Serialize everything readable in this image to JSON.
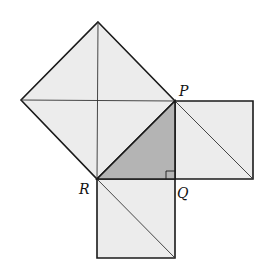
{
  "diagram": {
    "type": "pythagorean-squares",
    "colors": {
      "square_fill": "#ececec",
      "triangle_fill": "#b4b4b4",
      "stroke": "#1a1a1a",
      "background": "#ffffff"
    },
    "points": {
      "P": [
        175,
        101
      ],
      "Q": [
        175,
        179
      ],
      "R": [
        97,
        179
      ]
    },
    "labels": {
      "P": "P",
      "Q": "Q",
      "R": "R"
    },
    "shapes": {
      "hypotenuse_square": [
        [
          98,
          22
        ],
        [
          175,
          101
        ],
        [
          97,
          179
        ],
        [
          21,
          100
        ]
      ],
      "right_square": [
        [
          175,
          101
        ],
        [
          253,
          101
        ],
        [
          253,
          179
        ],
        [
          175,
          179
        ]
      ],
      "bottom_square": [
        [
          97,
          179
        ],
        [
          175,
          179
        ],
        [
          175,
          258
        ],
        [
          97,
          258
        ]
      ],
      "triangle_PQR": [
        [
          175,
          101
        ],
        [
          175,
          179
        ],
        [
          97,
          179
        ]
      ]
    },
    "right_angle_marker_at": "Q"
  }
}
